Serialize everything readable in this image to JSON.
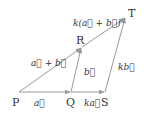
{
  "figure": {
    "type": "vector-diagram",
    "colors": {
      "line": "#999999",
      "text": "#333333",
      "background": "#ffffff"
    },
    "points": {
      "P": {
        "label": "P",
        "x": 19,
        "y": 92
      },
      "Q": {
        "label": "Q",
        "x": 71,
        "y": 92
      },
      "S": {
        "label": "S",
        "x": 105,
        "y": 92
      },
      "R": {
        "label": "R",
        "x": 82,
        "y": 47
      },
      "T": {
        "label": "T",
        "x": 126,
        "y": 17
      }
    },
    "vectors": [
      {
        "from": "P",
        "to": "Q",
        "label": "a⃗"
      },
      {
        "from": "Q",
        "to": "S",
        "label": "ka⃗"
      },
      {
        "from": "Q",
        "to": "R",
        "label": "b⃗"
      },
      {
        "from": "S",
        "to": "T",
        "label": "kb⃗"
      },
      {
        "from": "P",
        "to": "R",
        "label": "a⃗ + b⃗"
      },
      {
        "from": "R",
        "to": "T",
        "label": "k(a⃗ + b⃗)"
      }
    ]
  }
}
